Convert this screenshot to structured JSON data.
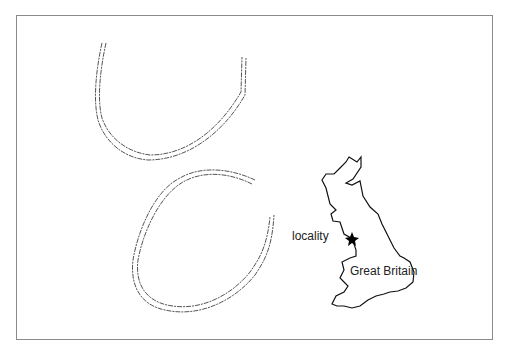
{
  "figure": {
    "labels": {
      "locality": "locality",
      "country": "Great Britain"
    },
    "colors": {
      "border": "#8a8a8a",
      "trace": "#555555",
      "map_outline": "#111111",
      "star": "#000000"
    },
    "elements": [
      "upper-trace-fossil",
      "lower-trace-fossil",
      "great-britain-map",
      "locality-star"
    ]
  }
}
